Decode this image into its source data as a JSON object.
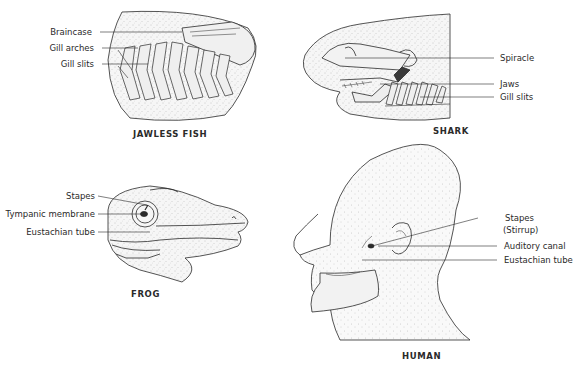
{
  "panels": {
    "jawless_fish": {
      "caption": "JAWLESS FISH",
      "labels": [
        "Braincase",
        "Gill arches",
        "Gill slits"
      ]
    },
    "shark": {
      "caption": "SHARK",
      "labels": [
        "Spiracle",
        "Jaws",
        "Gill slits"
      ]
    },
    "frog": {
      "caption": "FROG",
      "labels": [
        "Stapes",
        "Tympanic membrane",
        "Eustachian tube"
      ]
    },
    "human": {
      "caption": "HUMAN",
      "labels": [
        "Stapes",
        "(Stirrup)",
        "Auditory canal",
        "Eustachian tube"
      ]
    }
  },
  "colors": {
    "ink": "#2a2a2a",
    "stipple": "#b5b5b5",
    "fill": "#f4f4f4"
  }
}
